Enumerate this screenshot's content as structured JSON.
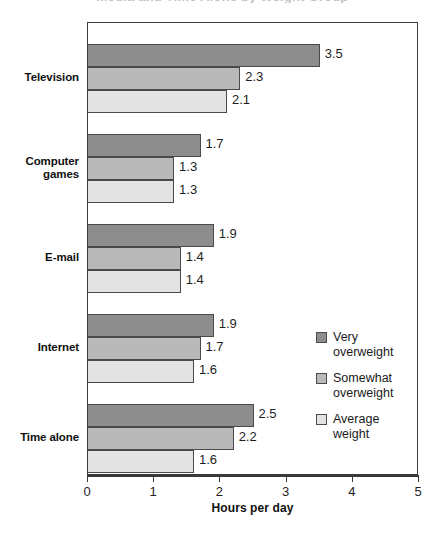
{
  "chart_data": {
    "type": "bar",
    "orientation": "horizontal",
    "title": "",
    "xlabel": "Hours per day",
    "ylabel": "",
    "xlim": [
      0,
      5
    ],
    "xticks": [
      "0",
      "1",
      "2",
      "3",
      "4",
      "5"
    ],
    "grid": false,
    "legend_position": "inside-right",
    "categories": [
      "Television",
      "Computer games",
      "E-mail",
      "Internet",
      "Time alone"
    ],
    "category_lines": [
      [
        "Television"
      ],
      [
        "Computer",
        "games"
      ],
      [
        "E-mail"
      ],
      [
        "Internet"
      ],
      [
        "Time alone"
      ]
    ],
    "series": [
      {
        "name": "Very overweight",
        "name_lines": [
          "Very",
          "overweight"
        ],
        "color": "#8d8d8d",
        "values": [
          3.5,
          1.7,
          1.9,
          1.9,
          2.5
        ],
        "labels": [
          "3.5",
          "1.7",
          "1.9",
          "1.9",
          "2.5"
        ]
      },
      {
        "name": "Somewhat overweight",
        "name_lines": [
          "Somewhat",
          "overweight"
        ],
        "color": "#b9b9b9",
        "values": [
          2.3,
          1.3,
          1.4,
          1.7,
          2.2
        ],
        "labels": [
          "2.3",
          "1.3",
          "1.4",
          "1.7",
          "2.2"
        ]
      },
      {
        "name": "Average weight",
        "name_lines": [
          "Average",
          "weight"
        ],
        "color": "#e3e3e3",
        "values": [
          2.1,
          1.3,
          1.4,
          1.6,
          1.6
        ],
        "labels": [
          "2.1",
          "1.3",
          "1.4",
          "1.6",
          "1.6"
        ]
      }
    ]
  },
  "title_remnant": "Media and Time Alone by Weight Group"
}
